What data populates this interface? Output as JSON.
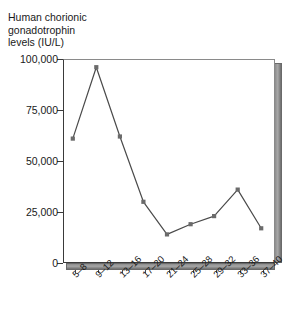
{
  "chart_data": {
    "type": "line",
    "title": "Human chorionic gonadotrophin levels (IU/L)",
    "ylabel": "Human chorionic\ngonadotrophin\nlevels (IU/L)",
    "xlabel": "",
    "categories": [
      "5–8",
      "9–12",
      "13–16",
      "17–20",
      "21–24",
      "25–28",
      "29–32",
      "33–36",
      "37–40"
    ],
    "values": [
      61000,
      96000,
      62000,
      30000,
      14000,
      19000,
      23000,
      36000,
      17000
    ],
    "series": [
      {
        "name": "Human chorionic gonadotrophin levels (IU/L)",
        "values": [
          61000,
          96000,
          62000,
          30000,
          14000,
          19000,
          23000,
          36000,
          17000
        ]
      }
    ],
    "ylim": [
      0,
      100000
    ],
    "y_ticks": [
      0,
      25000,
      50000,
      75000,
      100000
    ],
    "y_tick_labels": [
      "0",
      "25,000",
      "50,000",
      "75,000",
      "100,000"
    ],
    "grid": false,
    "legend": false,
    "legend_position": "none",
    "marker": "square",
    "line_color": "#4a4a4a",
    "marker_color": "#6b6b6b",
    "frame_3d_color": "#8d8d8d",
    "background_color": "#ffffff",
    "text_color": "#1a1a1a"
  }
}
